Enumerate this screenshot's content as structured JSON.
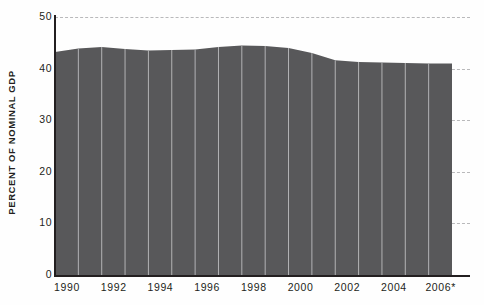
{
  "chart_data": {
    "type": "area",
    "title": "",
    "xlabel": "",
    "ylabel": "PERCENT OF NOMINAL GDP",
    "ylim": [
      0,
      50
    ],
    "ytick_values": [
      0,
      10,
      20,
      30,
      40,
      50
    ],
    "ytick_labels": [
      "0",
      "10",
      "20",
      "30",
      "40",
      "50"
    ],
    "xtick_labels": [
      "1990",
      "1992",
      "1994",
      "1996",
      "1998",
      "2000",
      "2002",
      "2004",
      "2006*"
    ],
    "xtick_years": [
      1990,
      1992,
      1994,
      1996,
      1998,
      2000,
      2002,
      2004,
      2006
    ],
    "xlim": [
      1990,
      2007
    ],
    "grid": "horizontal-dashed",
    "legend": "none",
    "annotation": "*",
    "series": [
      {
        "name": "Percent of nominal GDP",
        "x": [
          1990,
          1991,
          1992,
          1993,
          1994,
          1995,
          1996,
          1997,
          1998,
          1999,
          2000,
          2001,
          2002,
          2003,
          2004,
          2005,
          2006
        ],
        "values": [
          43.2,
          43.9,
          44.2,
          43.8,
          43.5,
          43.6,
          43.7,
          44.2,
          44.5,
          44.4,
          44.0,
          43.0,
          41.6,
          41.3,
          41.2,
          41.1,
          41.0
        ],
        "fill_color": "#58585a",
        "divider_color": "#b3b3b5"
      }
    ]
  },
  "axes": {
    "y_title": "PERCENT OF NOMINAL GDP",
    "axis_color": "#231f20",
    "gridline_color": "#b9b9bb"
  }
}
